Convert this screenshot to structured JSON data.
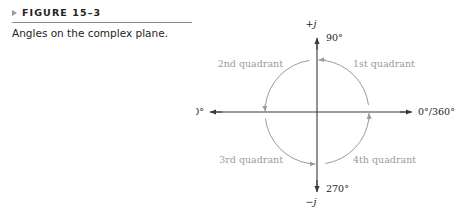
{
  "figure": {
    "marker_icon": "triangle-right-icon",
    "number_label": "FIGURE 15–3",
    "caption": "Angles on the complex plane."
  },
  "diagram": {
    "axes": {
      "positive_imaginary_symbol": "+j",
      "negative_imaginary_symbol": "−j",
      "angle_top": "90°",
      "angle_left": "180°",
      "angle_right": "0°/360°",
      "angle_bottom": "270°"
    },
    "quadrants": [
      {
        "id": "quadrant-1",
        "label": "1st quadrant"
      },
      {
        "id": "quadrant-2",
        "label": "2nd quadrant"
      },
      {
        "id": "quadrant-3",
        "label": "3rd quadrant"
      },
      {
        "id": "quadrant-4",
        "label": "4th quadrant"
      }
    ],
    "rotation_direction": "counterclockwise"
  },
  "colors": {
    "ink": "#231f20",
    "rule": "#8c8c8c",
    "marker": "#9a9a9a",
    "arc_gray": "#9b9b9b",
    "axis": "#3a3a3a",
    "background": "#ffffff"
  }
}
